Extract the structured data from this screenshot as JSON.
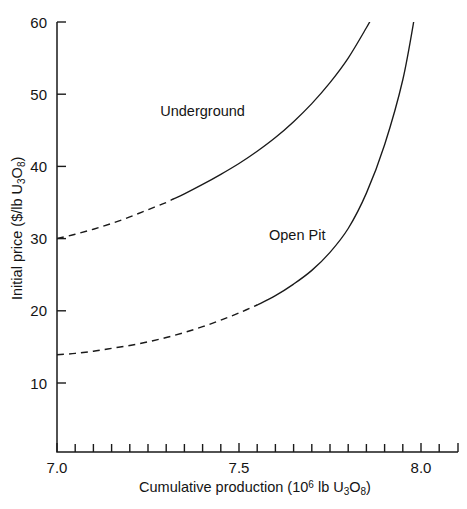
{
  "chart_data": {
    "type": "line",
    "title": "",
    "xlabel": "Cumulative production (10^6 lb U3O8)",
    "ylabel": "Initial price ($/lb U3O8)",
    "xlim": [
      7.0,
      8.05
    ],
    "ylim": [
      7.0,
      60.0
    ],
    "grid": false,
    "legend_position": "inline-annotations",
    "x_major_ticks": [
      7.0,
      7.5,
      8.0
    ],
    "x_major_tick_labels": [
      "7.0",
      "7.5",
      "8.0"
    ],
    "x_minor_ticks": [
      7.05,
      7.1,
      7.15,
      7.2,
      7.25,
      7.3,
      7.35,
      7.4,
      7.45,
      7.55,
      7.6,
      7.65,
      7.7,
      7.75,
      7.8,
      7.85,
      7.9,
      7.95,
      8.05
    ],
    "y_major_ticks": [
      10,
      20,
      30,
      40,
      50,
      60
    ],
    "y_major_tick_labels": [
      "10",
      "20",
      "30",
      "40",
      "50",
      "60"
    ],
    "series": [
      {
        "name": "Underground",
        "label_text": "Underground",
        "style": "dashed-then-solid",
        "dash_until_x": 7.32,
        "points": [
          [
            7.0,
            30.0
          ],
          [
            7.05,
            30.6
          ],
          [
            7.1,
            31.3
          ],
          [
            7.15,
            32.1
          ],
          [
            7.2,
            33.0
          ],
          [
            7.25,
            34.0
          ],
          [
            7.3,
            35.0
          ],
          [
            7.32,
            35.5
          ],
          [
            7.35,
            36.2
          ],
          [
            7.4,
            37.5
          ],
          [
            7.45,
            38.9
          ],
          [
            7.5,
            40.4
          ],
          [
            7.55,
            42.1
          ],
          [
            7.6,
            44.0
          ],
          [
            7.65,
            46.2
          ],
          [
            7.7,
            48.7
          ],
          [
            7.75,
            51.6
          ],
          [
            7.8,
            55.0
          ],
          [
            7.85,
            59.2
          ],
          [
            7.875,
            61.5
          ]
        ]
      },
      {
        "name": "Open Pit",
        "label_text": "Open Pit",
        "style": "dashed-then-solid",
        "dash_until_x": 7.55,
        "points": [
          [
            7.0,
            13.9
          ],
          [
            7.05,
            14.1
          ],
          [
            7.1,
            14.4
          ],
          [
            7.15,
            14.8
          ],
          [
            7.2,
            15.2
          ],
          [
            7.25,
            15.7
          ],
          [
            7.3,
            16.3
          ],
          [
            7.35,
            17.0
          ],
          [
            7.4,
            17.8
          ],
          [
            7.45,
            18.7
          ],
          [
            7.5,
            19.7
          ],
          [
            7.55,
            20.8
          ],
          [
            7.6,
            22.1
          ],
          [
            7.65,
            23.7
          ],
          [
            7.7,
            25.6
          ],
          [
            7.75,
            28.1
          ],
          [
            7.8,
            31.4
          ],
          [
            7.85,
            36.3
          ],
          [
            7.9,
            43.0
          ],
          [
            7.95,
            52.0
          ],
          [
            7.985,
            61.5
          ]
        ]
      }
    ],
    "annotations": [
      {
        "text": "Underground",
        "x": 7.4,
        "y": 47.0
      },
      {
        "text": "Open Pit",
        "x": 7.66,
        "y": 29.8
      }
    ]
  },
  "axis_titles": {
    "y_prefix": "Initial price ($/lb U",
    "y_sub1": "3",
    "y_mid": "O",
    "y_sub2": "8",
    "y_suffix": ")",
    "x_prefix": "Cumulative production (10",
    "x_sup": "6",
    "x_mid": " lb U",
    "x_sub1": "3",
    "x_mid2": "O",
    "x_sub2": "8",
    "x_suffix": ")"
  },
  "colors": {
    "ink": "#1a1a1a",
    "background": "#ffffff"
  }
}
